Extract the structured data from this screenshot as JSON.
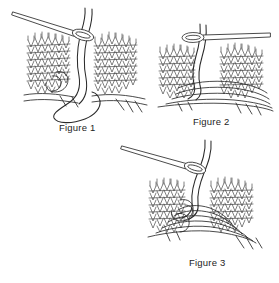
{
  "document": {
    "title": "Kitchener Stitch Grafting Instructions",
    "background_color": "#ffffff",
    "ink_color": "#2b2b2b",
    "width": 279,
    "height": 283,
    "style": "black and white line art illustration"
  },
  "figures": [
    {
      "id": "figure-1",
      "label": "Figure 1",
      "subject": "knitted fabric panels with tapestry needle and working yarn loop",
      "needle": {
        "name": "tapestry-needle",
        "direction": "points up-left, eye at lower-right",
        "eye_shape": "elongated oval"
      },
      "fabric_panels": 2,
      "yarn_loop": "large open loop hanging below the fabric edge"
    },
    {
      "id": "figure-2",
      "label": "Figure 2",
      "subject": "knitted fabric panels with tapestry needle horizontal and grafted yarn loops",
      "needle": {
        "name": "tapestry-needle",
        "direction": "points right, eye at left",
        "eye_shape": "elongated oval"
      },
      "fabric_panels": 2,
      "yarn_loop": "several grafting loops drawn across the lower edge"
    },
    {
      "id": "figure-3",
      "label": "Figure 3",
      "subject": "knitted fabric panels with tapestry needle and completed grafting stitches",
      "needle": {
        "name": "tapestry-needle",
        "direction": "points up-left, eye at lower-right",
        "eye_shape": "elongated oval"
      },
      "fabric_panels": 2,
      "yarn_loop": "multiple interlocking grafted loops along the seam"
    }
  ]
}
